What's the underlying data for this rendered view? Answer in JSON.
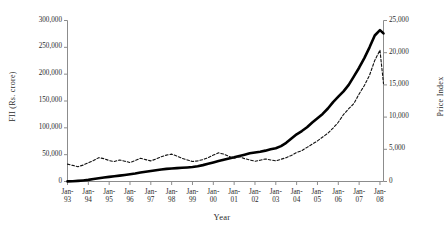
{
  "chart_data": {
    "type": "line",
    "title": "",
    "xlabel": "Year",
    "ylabel": "FII (Rs. crore)",
    "ylabel_right": "Price Index",
    "grid": false,
    "legend_position": "none",
    "categories": [
      "Jan-93",
      "Jan-94",
      "Jan-95",
      "Jan-96",
      "Jan-97",
      "Jan-98",
      "Jan-99",
      "Jan-00",
      "Jan-01",
      "Jan-02",
      "Jan-03",
      "Jan-04",
      "Jan-05",
      "Jan-06",
      "Jan-07",
      "Jan-08"
    ],
    "xticklabels_line1": [
      "Jan-",
      "Jan-",
      "Jan-",
      "Jan-",
      "Jan-",
      "Jan-",
      "Jan-",
      "Jan-",
      "Jan-",
      "Jan-",
      "Jan-",
      "Jan-",
      "Jan-",
      "Jan-",
      "Jan-",
      "Jan-"
    ],
    "xticklabels_line2": [
      "93",
      "94",
      "95",
      "96",
      "97",
      "98",
      "99",
      "00",
      "01",
      "02",
      "03",
      "04",
      "05",
      "06",
      "07",
      "08"
    ],
    "ylim_left": [
      0,
      300000
    ],
    "yticks_left": [
      0,
      50000,
      100000,
      150000,
      200000,
      250000,
      300000
    ],
    "yticklabels_left": [
      "0",
      "50,000",
      "100,000",
      "150,000",
      "200,000",
      "250,000",
      "300,000"
    ],
    "ylim_right": [
      0,
      25000
    ],
    "yticks_right": [
      0,
      5000,
      10000,
      15000,
      20000,
      25000
    ],
    "yticklabels_right": [
      "0",
      "5,000",
      "10,000",
      "15,000",
      "20,000",
      "25,000"
    ],
    "series": [
      {
        "name": "FII (Rs. crore)",
        "axis": "left",
        "style": "solid",
        "color": "#000000",
        "width": 2.6,
        "x": [
          1993.0,
          1993.25,
          1993.5,
          1993.75,
          1994.0,
          1994.25,
          1994.5,
          1994.75,
          1995.0,
          1995.25,
          1995.5,
          1995.75,
          1996.0,
          1996.25,
          1996.5,
          1996.75,
          1997.0,
          1997.25,
          1997.5,
          1997.75,
          1998.0,
          1998.25,
          1998.5,
          1998.75,
          1999.0,
          1999.25,
          1999.5,
          1999.75,
          2000.0,
          2000.25,
          2000.5,
          2000.75,
          2001.0,
          2001.25,
          2001.5,
          2001.75,
          2002.0,
          2002.25,
          2002.5,
          2002.75,
          2003.0,
          2003.25,
          2003.5,
          2003.75,
          2004.0,
          2004.25,
          2004.5,
          2004.75,
          2005.0,
          2005.25,
          2005.5,
          2005.75,
          2006.0,
          2006.25,
          2006.5,
          2006.75,
          2007.0,
          2007.25,
          2007.5,
          2007.75,
          2008.0,
          2008.17
        ],
        "values": [
          200,
          600,
          1200,
          2000,
          3000,
          4500,
          6000,
          7400,
          8600,
          9800,
          11000,
          12200,
          13500,
          15000,
          16800,
          18200,
          19500,
          21000,
          22500,
          23500,
          24200,
          25000,
          25600,
          26200,
          27000,
          28500,
          30500,
          33000,
          35500,
          38000,
          40500,
          43000,
          45000,
          47500,
          50000,
          52500,
          54000,
          55500,
          57500,
          60000,
          62000,
          66000,
          72000,
          80000,
          88000,
          94000,
          101000,
          110000,
          118000,
          126000,
          136000,
          148000,
          158000,
          168000,
          180000,
          196000,
          212000,
          230000,
          250000,
          272000,
          282000,
          276000
        ]
      },
      {
        "name": "Price Index",
        "axis": "right",
        "style": "dashed",
        "color": "#111111",
        "width": 1.1,
        "x": [
          1993.0,
          1993.25,
          1993.5,
          1993.75,
          1994.0,
          1994.25,
          1994.5,
          1994.75,
          1995.0,
          1995.25,
          1995.5,
          1995.75,
          1996.0,
          1996.25,
          1996.5,
          1996.75,
          1997.0,
          1997.25,
          1997.5,
          1997.75,
          1998.0,
          1998.25,
          1998.5,
          1998.75,
          1999.0,
          1999.25,
          1999.5,
          1999.75,
          2000.0,
          2000.25,
          2000.5,
          2000.75,
          2001.0,
          2001.25,
          2001.5,
          2001.75,
          2002.0,
          2002.25,
          2002.5,
          2002.75,
          2003.0,
          2003.25,
          2003.5,
          2003.75,
          2004.0,
          2004.25,
          2004.5,
          2004.75,
          2005.0,
          2005.25,
          2005.5,
          2005.75,
          2006.0,
          2006.25,
          2006.5,
          2006.75,
          2007.0,
          2007.25,
          2007.5,
          2007.75,
          2008.0,
          2008.17
        ],
        "values": [
          2700,
          2500,
          2300,
          2550,
          2900,
          3250,
          3700,
          3550,
          3250,
          3100,
          3350,
          3150,
          2950,
          3250,
          3600,
          3400,
          3200,
          3500,
          3850,
          4100,
          4250,
          3950,
          3600,
          3350,
          3100,
          3200,
          3400,
          3700,
          4100,
          4450,
          4250,
          3900,
          3600,
          3850,
          3550,
          3350,
          3150,
          3300,
          3500,
          3350,
          3200,
          3450,
          3700,
          4050,
          4500,
          4800,
          5300,
          5800,
          6300,
          6900,
          7500,
          8300,
          9200,
          10400,
          11300,
          12100,
          13600,
          14900,
          16500,
          18800,
          20400,
          15200
        ]
      }
    ]
  }
}
